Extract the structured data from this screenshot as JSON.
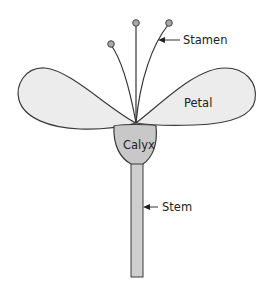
{
  "diagram": {
    "labels": {
      "stamen": "Stamen",
      "petal": "Petal",
      "calyx": "Calyx",
      "stem": "Stem"
    },
    "colors": {
      "petal_fill": "#ececec",
      "calyx_fill": "#c8c8c8",
      "stem_fill": "#cfcfcf",
      "anther_fill": "#a8a8a8",
      "outline": "#3a3a3a"
    }
  }
}
